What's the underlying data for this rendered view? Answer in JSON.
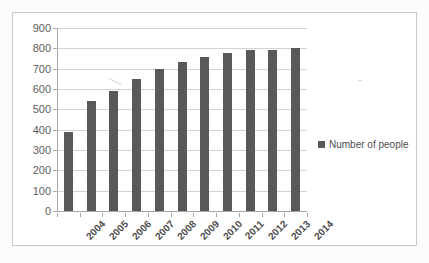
{
  "chart_data": {
    "type": "bar",
    "title": "",
    "subtitle": "",
    "xlabel": "",
    "ylabel": "",
    "categories": [
      "2004",
      "2005",
      "2006",
      "2007",
      "2008",
      "2009",
      "2010",
      "2011",
      "2012",
      "2013",
      "2014"
    ],
    "series": [
      {
        "name": "Number of people",
        "color": "#595959",
        "values": [
          390,
          540,
          590,
          650,
          700,
          735,
          755,
          775,
          793,
          790,
          800
        ]
      }
    ],
    "values": [
      390,
      540,
      590,
      650,
      700,
      735,
      755,
      775,
      793,
      790,
      800
    ],
    "ylim": [
      0,
      900
    ],
    "ytick_step": 100,
    "yticks": [
      "900",
      "800",
      "700",
      "600",
      "500",
      "400",
      "300",
      "200",
      "100",
      "0"
    ],
    "grid": true,
    "grid_axis": "y",
    "legend": {
      "position": "right",
      "entries": [
        {
          "label": "Number of people",
          "color": "#595959",
          "marker": "square-swatch"
        }
      ]
    },
    "axis_color": "#a6a6a6",
    "gridline_color": "#d4d4d4",
    "plot_background": "#ffffff",
    "frame_border_color": "#c9c9c9"
  }
}
